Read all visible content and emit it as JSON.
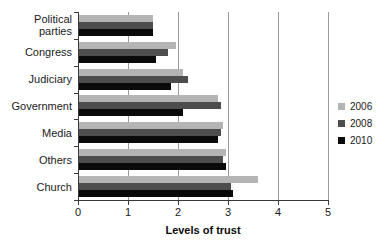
{
  "chart_data": {
    "type": "bar",
    "orientation": "horizontal",
    "title": "",
    "xlabel": "Levels of trust",
    "ylabel": "",
    "xlim": [
      0,
      5
    ],
    "xticks": [
      "0",
      "1",
      "2",
      "3",
      "4",
      "5"
    ],
    "grid": true,
    "legend_position": "right",
    "categories": [
      "Political\nparties",
      "Congress",
      "Judiciary",
      "Government",
      "Media",
      "Others",
      "Church"
    ],
    "category_labels": [
      [
        "Political",
        "parties"
      ],
      [
        "Congress"
      ],
      [
        "Judiciary"
      ],
      [
        "Government"
      ],
      [
        "Media"
      ],
      [
        "Others"
      ],
      [
        "Church"
      ]
    ],
    "series": [
      {
        "name": "2006",
        "color": "#b4b4b4",
        "values": [
          1.5,
          1.95,
          2.1,
          2.8,
          2.9,
          2.95,
          3.6
        ]
      },
      {
        "name": "2008",
        "color": "#4d4d4d",
        "values": [
          1.5,
          1.8,
          2.2,
          2.85,
          2.85,
          2.9,
          3.05
        ]
      },
      {
        "name": "2010",
        "color": "#0a0a0a",
        "values": [
          1.5,
          1.55,
          1.85,
          2.1,
          2.8,
          2.95,
          3.1
        ]
      }
    ]
  },
  "legend": {
    "entries": [
      {
        "label": "2006",
        "color": "#b4b4b4"
      },
      {
        "label": "2008",
        "color": "#4d4d4d"
      },
      {
        "label": "2010",
        "color": "#0a0a0a"
      }
    ]
  },
  "axis": {
    "x_title": "Levels of trust"
  }
}
